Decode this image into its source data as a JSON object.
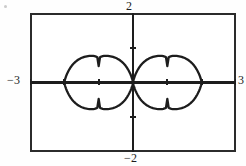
{
  "figure": {
    "kind": "graphing-calculator-plot",
    "window_labels": {
      "ymax": "2",
      "ymin": "−2",
      "xmin": "−3",
      "xmax": "3"
    },
    "stroke_color": "#1d1d1d",
    "frame_color": "#2b2b2b",
    "background_color": "#ffffff"
  },
  "chart_data": {
    "type": "line",
    "title": "",
    "xlabel": "",
    "ylabel": "",
    "xlim": [
      -3,
      3
    ],
    "ylim": [
      -2,
      2
    ],
    "grid": false,
    "legend": null,
    "axes": {
      "x_axis_drawn": true,
      "y_axis_drawn": true,
      "x_tick_values": [
        -3,
        -2,
        -1,
        1,
        2,
        3
      ],
      "y_tick_values": [
        -1,
        1
      ],
      "tick_mark_style": "short-dash",
      "axis_labels_shown": [
        "2",
        "-2",
        "-3",
        "3"
      ]
    },
    "series": [
      {
        "name": "two-petal rose (lemniscate-like) r = 2cos(θ)-ish",
        "description": "Closed curve with two symmetric oval petals meeting at the origin; petals span x from -2 to 2 and reach y of about ±0.85.",
        "petals": [
          {
            "side": "left",
            "x_range": [
              -2.0,
              0.0
            ],
            "y_range": [
              -0.85,
              0.85
            ],
            "center_x": -1.0,
            "max_half_height": 0.85
          },
          {
            "side": "right",
            "x_range": [
              0.0,
              2.0
            ],
            "y_range": [
              -0.85,
              0.85
            ],
            "center_x": 1.0,
            "max_half_height": 0.85
          }
        ],
        "points": [
          [
            0.0,
            0.0
          ],
          [
            -0.25,
            0.42
          ],
          [
            -0.5,
            0.62
          ],
          [
            -0.8,
            0.77
          ],
          [
            -1.1,
            0.84
          ],
          [
            -1.4,
            0.83
          ],
          [
            -1.65,
            0.72
          ],
          [
            -1.85,
            0.52
          ],
          [
            -1.97,
            0.27
          ],
          [
            -2.0,
            0.0
          ],
          [
            -1.97,
            -0.27
          ],
          [
            -1.85,
            -0.52
          ],
          [
            -1.65,
            -0.72
          ],
          [
            -1.4,
            -0.83
          ],
          [
            -1.1,
            -0.84
          ],
          [
            -0.8,
            -0.77
          ],
          [
            -0.5,
            -0.62
          ],
          [
            -0.25,
            -0.42
          ],
          [
            0.0,
            0.0
          ],
          [
            0.25,
            0.42
          ],
          [
            0.5,
            0.62
          ],
          [
            0.8,
            0.77
          ],
          [
            1.1,
            0.84
          ],
          [
            1.4,
            0.83
          ],
          [
            1.65,
            0.72
          ],
          [
            1.85,
            0.52
          ],
          [
            1.97,
            0.27
          ],
          [
            2.0,
            0.0
          ],
          [
            1.97,
            -0.27
          ],
          [
            1.85,
            -0.52
          ],
          [
            1.65,
            -0.72
          ],
          [
            1.4,
            -0.83
          ],
          [
            1.1,
            -0.84
          ],
          [
            0.8,
            -0.77
          ],
          [
            0.5,
            -0.62
          ],
          [
            0.25,
            -0.42
          ],
          [
            0.0,
            0.0
          ]
        ]
      }
    ]
  }
}
